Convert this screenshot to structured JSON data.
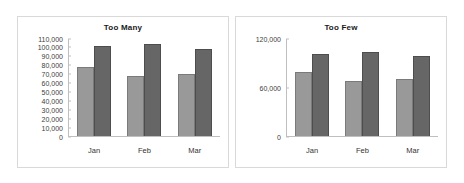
{
  "chart_data": [
    {
      "type": "bar",
      "title": "Too Many",
      "categories": [
        "Jan",
        "Feb",
        "Mar"
      ],
      "series": [
        {
          "name": "series-1",
          "color": "#999999",
          "values": [
            78000,
            67000,
            70000
          ]
        },
        {
          "name": "series-2",
          "color": "#666666",
          "values": [
            101000,
            103500,
            98500
          ]
        }
      ],
      "xlabel": "",
      "ylabel": "",
      "ylim": [
        0,
        110000
      ],
      "ytick_step": 10000,
      "yticks": [
        "0",
        "10,000",
        "20,000",
        "30,000",
        "40,000",
        "50,000",
        "60,000",
        "70,000",
        "80,000",
        "90,000",
        "100,000",
        "110,000"
      ],
      "grid": false,
      "legend": "none"
    },
    {
      "type": "bar",
      "title": "Too Few",
      "categories": [
        "Jan",
        "Feb",
        "Mar"
      ],
      "series": [
        {
          "name": "series-1",
          "color": "#999999",
          "values": [
            78000,
            67000,
            70000
          ]
        },
        {
          "name": "series-2",
          "color": "#666666",
          "values": [
            101000,
            103500,
            98500
          ]
        }
      ],
      "xlabel": "",
      "ylabel": "",
      "ylim": [
        0,
        120000
      ],
      "ytick_step": 60000,
      "yticks": [
        "0",
        "60,000",
        "120,000"
      ],
      "grid": false,
      "legend": "none"
    }
  ]
}
